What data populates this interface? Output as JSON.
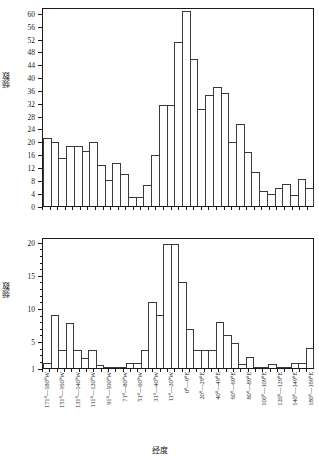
{
  "figure": {
    "xaxis_title": "经度",
    "bin_labels": [
      "171°—180°W",
      "161°—170°W",
      "151°—160°W",
      "141°—150°W",
      "131°—140°W",
      "121°—130°W",
      "111°—120°W",
      "101°—110°W",
      "91°—100°W",
      "81°—90°W",
      "71°—80°W",
      "61°—70°W",
      "51°—60°W",
      "41°—50°W",
      "31°—40°W",
      "21°—30°W",
      "11°—20°W",
      "1°—10°W",
      "0°—9°E",
      "10°—19°E",
      "20°—29°E",
      "30°—39°E",
      "40°—49°E",
      "50°—59°E",
      "60°—69°E",
      "70°—79°E",
      "80°—89°E",
      "90°—99°E",
      "100°—109°E",
      "110°—119°E",
      "120°—129°E",
      "130°—139°E",
      "140°—149°E",
      "150°—159°E",
      "180°—169°E"
    ],
    "visible_tick_labels": [
      "171°—180°W",
      "151°—160°W",
      "131°—140°W",
      "111°—120°W",
      "91°—100°W",
      "71°—80°W",
      "51°—60°W",
      "31°—40°W",
      "11°—20°W",
      "0°—9°E",
      "20°—29°E",
      "40°—49°E",
      "60°—69°E",
      "80°—89°E",
      "100°—109°E",
      "120°—129°E",
      "140°—149°E",
      "180°—169°E"
    ]
  },
  "chart_data": [
    {
      "type": "bar",
      "panel": "(a)",
      "title": "",
      "xlabel": "经度",
      "ylabel": "频数",
      "ylim": [
        0,
        62
      ],
      "yticks": [
        0,
        4,
        8,
        12,
        16,
        20,
        24,
        28,
        32,
        36,
        40,
        44,
        48,
        52,
        56,
        60
      ],
      "grid": false,
      "categories": [
        "171°—180°W",
        "161°—170°W",
        "151°—160°W",
        "141°—150°W",
        "131°—140°W",
        "121°—130°W",
        "111°—120°W",
        "101°—110°W",
        "91°—100°W",
        "81°—90°W",
        "71°—80°W",
        "61°—70°W",
        "51°—60°W",
        "41°—50°W",
        "31°—40°W",
        "21°—30°W",
        "11°—20°W",
        "1°—10°W",
        "0°—9°E",
        "10°—19°E",
        "20°—29°E",
        "30°—39°E",
        "40°—49°E",
        "50°—59°E",
        "60°—69°E",
        "70°—79°E",
        "80°—89°E",
        "90°—99°E",
        "100°—109°E",
        "110°—119°E",
        "120°—129°E",
        "130°—139°E",
        "140°—149°E",
        "150°—159°E",
        "180°—169°E"
      ],
      "values": [
        21.5,
        20.3,
        15.2,
        19.0,
        19.0,
        17.2,
        20.3,
        13.0,
        8.1,
        13.6,
        10.2,
        2.8,
        2.8,
        6.5,
        16.0,
        31.7,
        31.7,
        51.6,
        61.5,
        46.4,
        30.6,
        34.8,
        37.5,
        35.6,
        20.0,
        25.8,
        17.1,
        10.8,
        4.6,
        3.9,
        5.7,
        7.0,
        3.6,
        8.4,
        5.7
      ]
    },
    {
      "type": "bar",
      "panel": "(b)",
      "title": "",
      "xlabel": "经度",
      "ylabel": "频数",
      "ylim": [
        1,
        20.8
      ],
      "yticks": [
        1,
        5,
        10,
        15,
        20
      ],
      "grid": false,
      "categories": [
        "171°—180°W",
        "161°—170°W",
        "151°—160°W",
        "141°—150°W",
        "131°—140°W",
        "121°—130°W",
        "111°—120°W",
        "101°—110°W",
        "91°—100°W",
        "81°—90°W",
        "71°—80°W",
        "61°—70°W",
        "51°—60°W",
        "41°—50°W",
        "31°—40°W",
        "21°—30°W",
        "11°—20°W",
        "1°—10°W",
        "0°—9°E",
        "10°—19°E",
        "20°—29°E",
        "30°—39°E",
        "40°—49°E",
        "50°—59°E",
        "60°—69°E",
        "70°—79°E",
        "80°—89°E",
        "90°—99°E",
        "100°—109°E",
        "110°—119°E",
        "120°—129°E",
        "130°—139°E",
        "140°—149°E",
        "150°—159°E",
        "180°—169°E"
      ],
      "values": [
        1.8,
        9.1,
        3.8,
        7.9,
        3.8,
        2.6,
        3.8,
        1.5,
        1.1,
        1.1,
        1.1,
        1.7,
        1.7,
        3.8,
        11.1,
        9.1,
        20.0,
        20.0,
        14.2,
        7.0,
        3.8,
        3.8,
        3.8,
        8.1,
        6.0,
        4.8,
        1.6,
        2.7,
        1.1,
        1.0,
        1.6,
        1.0,
        1.0,
        1.7,
        1.7,
        4.0
      ]
    }
  ]
}
